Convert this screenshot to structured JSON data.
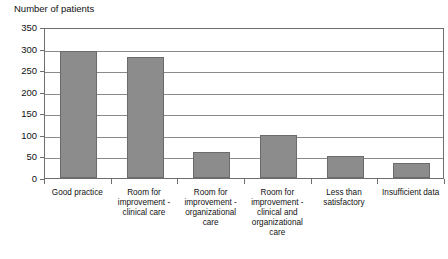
{
  "chart_data": {
    "type": "bar",
    "title": "",
    "xlabel": "",
    "ylabel": "Number of patients",
    "ylim": [
      0,
      350
    ],
    "yticks": [
      0,
      50,
      100,
      150,
      200,
      250,
      300,
      350
    ],
    "ytick_labels": [
      "0",
      "50",
      "100",
      "150",
      "200",
      "250",
      "300",
      "350"
    ],
    "grid": true,
    "legend": "none",
    "bar_color": "#8c8c8c",
    "bar_edge_color": "#6b6b6b",
    "axis_color": "#6e6e6e",
    "background_color": "#ffffff",
    "categories": [
      "Good practice",
      "Room for improvement - clinical care",
      "Room for improvement - organizational care",
      "Room for improvement - clinical and organizational care",
      "Less than satisfactory",
      "Insufficient data"
    ],
    "values": [
      295,
      280,
      60,
      100,
      50,
      35
    ]
  }
}
